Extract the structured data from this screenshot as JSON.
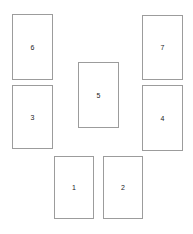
{
  "diagram": {
    "background_color": "#ffffff",
    "border_color": "#9c9c9c",
    "fill_color": "#ffffff",
    "label_color": "#1a1a1a",
    "canvas": {
      "width": 193,
      "height": 234
    },
    "shapes": [
      {
        "id": "rect-6",
        "label": "6",
        "x": 12,
        "y": 14,
        "width": 41,
        "height": 66
      },
      {
        "id": "rect-3",
        "label": "3",
        "x": 12,
        "y": 85,
        "width": 41,
        "height": 64
      },
      {
        "id": "rect-5",
        "label": "5",
        "x": 78,
        "y": 62,
        "width": 41,
        "height": 66
      },
      {
        "id": "rect-7",
        "label": "7",
        "x": 142,
        "y": 15,
        "width": 41,
        "height": 65
      },
      {
        "id": "rect-4",
        "label": "4",
        "x": 142,
        "y": 85,
        "width": 41,
        "height": 66
      },
      {
        "id": "rect-1",
        "label": "1",
        "x": 54,
        "y": 156,
        "width": 40,
        "height": 63
      },
      {
        "id": "rect-2",
        "label": "2",
        "x": 103,
        "y": 156,
        "width": 40,
        "height": 63
      }
    ]
  }
}
